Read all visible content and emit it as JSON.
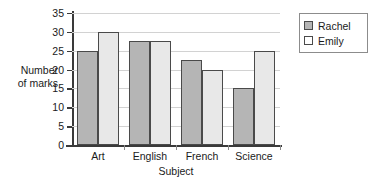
{
  "chart_data": {
    "type": "bar",
    "title": "",
    "xlabel": "Subject",
    "ylabel": "Number of marks",
    "ylabel_lines": [
      "Number",
      "of marks"
    ],
    "categories": [
      "Art",
      "English",
      "French",
      "Science"
    ],
    "series": [
      {
        "name": "Rachel",
        "values": [
          25,
          27.5,
          22.5,
          15
        ],
        "color": "#b5b5b5"
      },
      {
        "name": "Emily",
        "values": [
          30,
          27.5,
          20,
          25
        ],
        "color": "#e8e8e8"
      }
    ],
    "ylim": [
      0,
      35
    ],
    "yticks": [
      0,
      5,
      10,
      15,
      20,
      25,
      30,
      35
    ],
    "ytick_labels": [
      "0",
      "5",
      "10",
      "15",
      "20",
      "25",
      "30",
      "35"
    ],
    "grid": true,
    "legend": {
      "position": "top-right",
      "entries": [
        {
          "label": "Rachel",
          "swatch": "#b5b5b5"
        },
        {
          "label": "Emily",
          "swatch": "#ffffff"
        }
      ]
    },
    "bar_edge_color": "#4a4a4a",
    "grid_color": "#d2d2d2",
    "axis_color": "#3a3a3a"
  }
}
